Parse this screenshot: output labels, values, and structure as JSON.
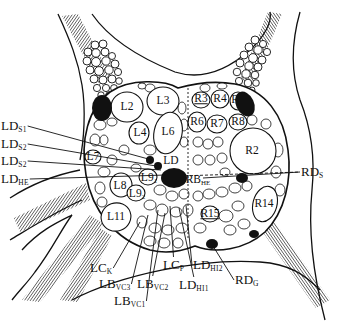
{
  "diagram": {
    "type": "anatomical line drawing (ganglion with identified neurons)",
    "colors": {
      "ink": "#111111",
      "background": "#ffffff"
    },
    "cell_labels": [
      {
        "id": "L2",
        "text": "L2",
        "x": 127,
        "y": 107
      },
      {
        "id": "L3",
        "text": "L3",
        "x": 163,
        "y": 101
      },
      {
        "id": "L4",
        "text": "L4",
        "x": 140,
        "y": 133
      },
      {
        "id": "L6",
        "text": "L6",
        "x": 168,
        "y": 132
      },
      {
        "id": "L7",
        "text": "L7",
        "x": 93,
        "y": 157
      },
      {
        "id": "L8",
        "text": "L8",
        "x": 120,
        "y": 186
      },
      {
        "id": "L9_1",
        "base": "L9",
        "sub": "1",
        "x": 149,
        "y": 178
      },
      {
        "id": "L9_2",
        "base": "L9",
        "sub": "2",
        "x": 137,
        "y": 194
      },
      {
        "id": "L11",
        "text": "L11",
        "x": 116,
        "y": 217
      },
      {
        "id": "LD",
        "text": "LD",
        "x": 171,
        "y": 161
      },
      {
        "id": "R2",
        "text": "R2",
        "x": 252,
        "y": 151
      },
      {
        "id": "R3",
        "text": "R3",
        "x": 201,
        "y": 99,
        "underline": true
      },
      {
        "id": "R4",
        "text": "R4",
        "x": 220,
        "y": 99
      },
      {
        "id": "R5",
        "text": "R5",
        "x": 238,
        "y": 100
      },
      {
        "id": "R6",
        "text": "R6",
        "x": 197,
        "y": 122
      },
      {
        "id": "R7",
        "text": "R7",
        "x": 217,
        "y": 124
      },
      {
        "id": "R8",
        "text": "R8",
        "x": 238,
        "y": 122
      },
      {
        "id": "R14",
        "text": "R14",
        "x": 264,
        "y": 204
      },
      {
        "id": "R15",
        "text": "R15",
        "x": 210,
        "y": 214,
        "underline": true
      },
      {
        "id": "RB_HE",
        "base": "RB",
        "sub": "HE",
        "x": 198,
        "y": 180
      }
    ],
    "callout_labels": [
      {
        "id": "LD_S1",
        "base": "LD",
        "sub": "S1",
        "x": 1,
        "y": 126,
        "line_to": [
          152,
          160
        ]
      },
      {
        "id": "LD_S2a",
        "base": "LD",
        "sub": "S2",
        "x": 1,
        "y": 144,
        "line_to": [
          156,
          166
        ]
      },
      {
        "id": "LD_S2b",
        "base": "LD",
        "sub": "S2",
        "x": 1,
        "y": 161,
        "line_to": [
          161,
          170
        ]
      },
      {
        "id": "LD_HE",
        "base": "LD",
        "sub": "HE",
        "x": 1,
        "y": 179,
        "line_to": [
          166,
          175
        ]
      },
      {
        "id": "RD_S",
        "base": "RD",
        "sub": "S",
        "x": 301,
        "y": 172,
        "line_to": [
          203,
          178
        ]
      },
      {
        "id": "RD_G",
        "base": "RD",
        "sub": "G",
        "x": 235,
        "y": 280,
        "line_to": [
          213,
          246
        ]
      },
      {
        "id": "LC_K",
        "base": "LC",
        "sub": "K",
        "x": 90,
        "y": 268,
        "line_to": [
          140,
          222
        ]
      },
      {
        "id": "LB_VC3",
        "base": "LB",
        "sub": "VC3",
        "x": 99,
        "y": 284,
        "line_to": [
          148,
          215
        ]
      },
      {
        "id": "LB_VC1",
        "base": "LB",
        "sub": "VC1",
        "x": 114,
        "y": 301,
        "line_to": [
          158,
          210
        ]
      },
      {
        "id": "LB_VC2",
        "base": "LB",
        "sub": "VC2",
        "x": 137,
        "y": 284,
        "line_to": [
          165,
          213
        ]
      },
      {
        "id": "LC_P",
        "base": "LC",
        "sub": "P",
        "x": 163,
        "y": 265,
        "line_to": [
          170,
          206
        ]
      },
      {
        "id": "LD_HI1",
        "base": "LD",
        "sub": "HI1",
        "x": 179,
        "y": 285,
        "line_to": [
          179,
          208
        ]
      },
      {
        "id": "LD_HI2",
        "base": "LD",
        "sub": "HI2",
        "x": 193,
        "y": 265,
        "line_to": [
          186,
          205
        ]
      }
    ]
  }
}
